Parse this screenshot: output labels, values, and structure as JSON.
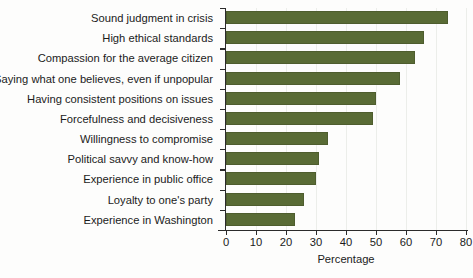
{
  "chart_data": {
    "type": "bar",
    "orientation": "horizontal",
    "title": "",
    "xlabel": "Percentage",
    "ylabel": "",
    "xlim": [
      0,
      80
    ],
    "xticks": [
      0,
      10,
      20,
      30,
      40,
      50,
      60,
      70,
      80
    ],
    "grid": "vertical-light",
    "legend": "none",
    "bar_color": "#596b35",
    "categories": [
      "Sound judgment in crisis",
      "High ethical standards",
      "Compassion for the average citizen",
      "Saying what one believes, even if unpopular",
      "Having consistent positions on issues",
      "Forcefulness and decisiveness",
      "Willingness to compromise",
      "Political savvy and know-how",
      "Experience in public office",
      "Loyalty to one's party",
      "Experience in Washington"
    ],
    "values": [
      74,
      66,
      63,
      58,
      50,
      49,
      34,
      31,
      30,
      26,
      23
    ]
  }
}
